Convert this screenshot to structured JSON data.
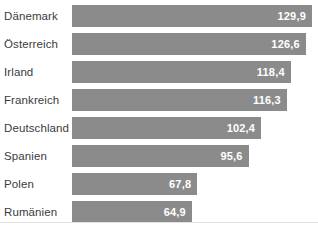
{
  "chart_data": {
    "type": "bar",
    "orientation": "horizontal",
    "title": "",
    "subtitle": "",
    "xlabel": "",
    "ylabel": "",
    "grid": false,
    "legend": null,
    "xlim": [
      0,
      129.9
    ],
    "decimal_separator": ",",
    "bar_color": "#8b8b8b",
    "label_color": "#3b3b3b",
    "value_label_color": "#ffffff",
    "background": "#ffffff",
    "categories": [
      "Dänemark",
      "Österreich",
      "Irland",
      "Frankreich",
      "Deutschland",
      "Spanien",
      "Polen",
      "Rumänien"
    ],
    "values": [
      129.9,
      126.6,
      118.4,
      116.3,
      102.4,
      95.6,
      67.8,
      64.9
    ],
    "value_labels": [
      "129,9",
      "126,6",
      "118,4",
      "116,3",
      "102,4",
      "95,6",
      "67,8",
      "64,9"
    ],
    "bars": [
      {
        "category": "Dänemark",
        "value": 129.9,
        "label": "129,9"
      },
      {
        "category": "Österreich",
        "value": 126.6,
        "label": "126,6"
      },
      {
        "category": "Irland",
        "value": 118.4,
        "label": "118,4"
      },
      {
        "category": "Frankreich",
        "value": 116.3,
        "label": "116,3"
      },
      {
        "category": "Deutschland",
        "value": 102.4,
        "label": "102,4"
      },
      {
        "category": "Spanien",
        "value": 95.6,
        "label": "95,6"
      },
      {
        "category": "Polen",
        "value": 67.8,
        "label": "67,8"
      },
      {
        "category": "Rumänien",
        "value": 64.9,
        "label": "64,9"
      }
    ]
  }
}
